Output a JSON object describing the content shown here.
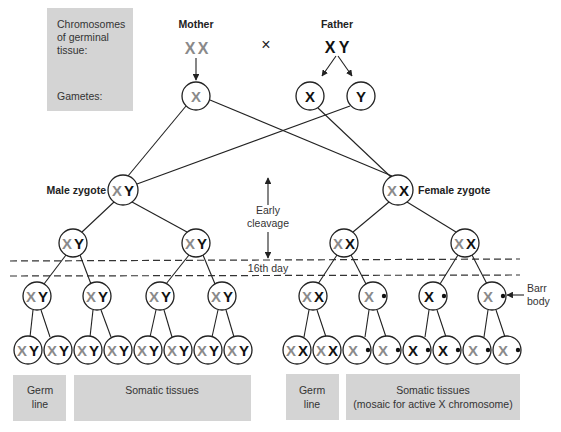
{
  "legend_box": {
    "line1": "Chromosomes",
    "line2": "of germinal",
    "line3": "tissue:",
    "gametes": "Gametes:"
  },
  "parents": {
    "mother": {
      "label": "Mother",
      "genotype_x1": "X",
      "genotype_x2": "X",
      "gamete": "X"
    },
    "cross_symbol": "×",
    "father": {
      "label": "Father",
      "genotype_x": "X",
      "genotype_y": "Y",
      "gamete1": "X",
      "gamete2": "Y"
    }
  },
  "zygotes": {
    "male": {
      "label": "Male zygote",
      "chrom1": "X",
      "chrom2": "Y"
    },
    "female": {
      "label": "Female zygote",
      "chrom1": "X",
      "chrom2": "X"
    }
  },
  "timeline": {
    "early_cleavage_1": "Early",
    "early_cleavage_2": "cleavage",
    "day_marker": "16th day"
  },
  "annotations": {
    "barr_1": "Barr",
    "barr_2": "body"
  },
  "chromosome_colors": {
    "maternal_x": "#8a8a8a",
    "paternal": "#111111"
  },
  "cells": {
    "X": "X",
    "Y": "Y"
  },
  "bottom_boxes": {
    "male_germ_1": "Germ",
    "male_germ_2": "line",
    "male_somatic": "Somatic tissues",
    "female_germ_1": "Germ",
    "female_germ_2": "line",
    "female_somatic_1": "Somatic tissues",
    "female_somatic_2": "(mosaic for active X chromosome)"
  }
}
